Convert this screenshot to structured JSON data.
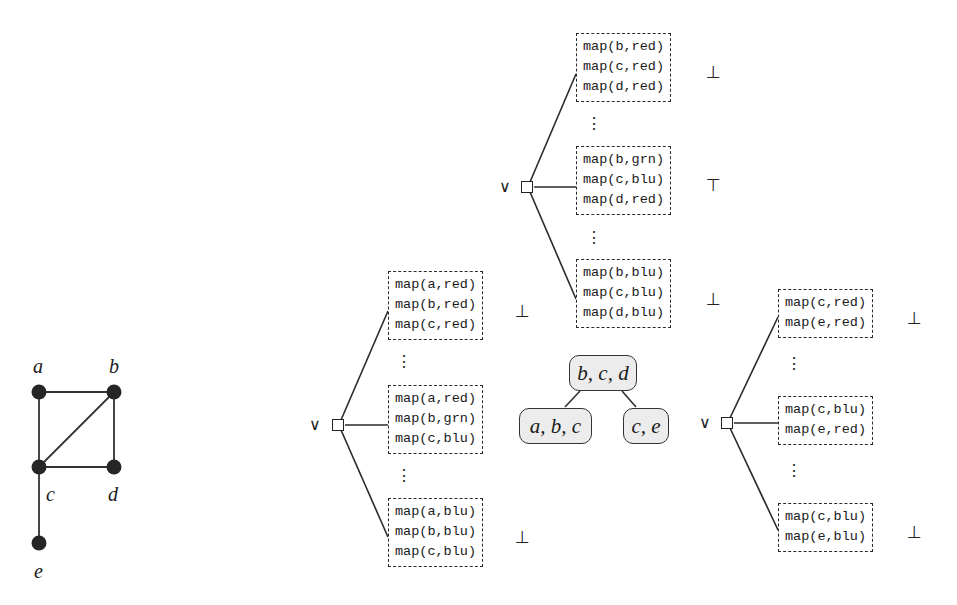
{
  "graph": {
    "nodes": [
      {
        "id": "a",
        "label": "a"
      },
      {
        "id": "b",
        "label": "b"
      },
      {
        "id": "c",
        "label": "c"
      },
      {
        "id": "d",
        "label": "d"
      },
      {
        "id": "e",
        "label": "e"
      }
    ],
    "edges": [
      [
        "a",
        "b"
      ],
      [
        "a",
        "c"
      ],
      [
        "b",
        "c"
      ],
      [
        "b",
        "d"
      ],
      [
        "c",
        "d"
      ],
      [
        "c",
        "e"
      ]
    ]
  },
  "tree_decomposition": {
    "root": {
      "label": "b, c, d"
    },
    "left_child": {
      "label": "a, b, c"
    },
    "right_child": {
      "label": "c, e"
    }
  },
  "or_symbol": "∨",
  "vdots": "⋮",
  "symbols": {
    "bottom": "⊥",
    "top": "⊤"
  },
  "trees": {
    "bcd": {
      "boxes": [
        {
          "rows": [
            "map(b,red)",
            "map(c,red)",
            "map(d,red)"
          ],
          "verdict": "⊥"
        },
        {
          "rows": [
            "map(b,grn)",
            "map(c,blu)",
            "map(d,red)"
          ],
          "verdict": "⊤"
        },
        {
          "rows": [
            "map(b,blu)",
            "map(c,blu)",
            "map(d,blu)"
          ],
          "verdict": "⊥"
        }
      ]
    },
    "abc": {
      "boxes": [
        {
          "rows": [
            "map(a,red)",
            "map(b,red)",
            "map(c,red)"
          ],
          "verdict": "⊥"
        },
        {
          "rows": [
            "map(a,red)",
            "map(b,grn)",
            "map(c,blu)"
          ],
          "verdict": ""
        },
        {
          "rows": [
            "map(a,blu)",
            "map(b,blu)",
            "map(c,blu)"
          ],
          "verdict": "⊥"
        }
      ]
    },
    "ce": {
      "boxes": [
        {
          "rows": [
            "map(c,red)",
            "map(e,red)"
          ],
          "verdict": "⊥"
        },
        {
          "rows": [
            "map(c,blu)",
            "map(e,red)"
          ],
          "verdict": ""
        },
        {
          "rows": [
            "map(c,blu)",
            "map(e,blu)"
          ],
          "verdict": "⊥"
        }
      ]
    }
  }
}
